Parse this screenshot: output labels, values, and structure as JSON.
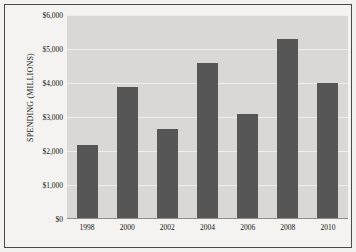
{
  "chart_data": {
    "type": "bar",
    "title": "",
    "subtitle": "",
    "xlabel": "",
    "ylabel": "SPENDING (MILLIONS)",
    "categories": [
      "1998",
      "2000",
      "2002",
      "2004",
      "2006",
      "2008",
      "2010"
    ],
    "values": [
      2150,
      3850,
      2620,
      4570,
      3070,
      5270,
      3970
    ],
    "series": [
      {
        "name": "Spending",
        "values": [
          2150,
          3850,
          2620,
          4570,
          3070,
          5270,
          3970
        ]
      }
    ],
    "ylim": [
      0,
      6000
    ],
    "ytick_values": [
      0,
      1000,
      2000,
      3000,
      4000,
      5000,
      6000
    ],
    "ytick_labels": [
      "$0",
      "$1,000",
      "$2,000",
      "$3,000",
      "$4,000",
      "$5,000",
      "$6,000"
    ],
    "grid": true,
    "legend": false,
    "legend_position": "none",
    "annotations": []
  },
  "style": {
    "bar_color": "#565656",
    "plot_background": "#d9d8d6",
    "figure_background": "#f4f3f1",
    "gridline_color": "#f0efed",
    "frame_color": "#4a4a4a",
    "text_color": "#141414"
  }
}
